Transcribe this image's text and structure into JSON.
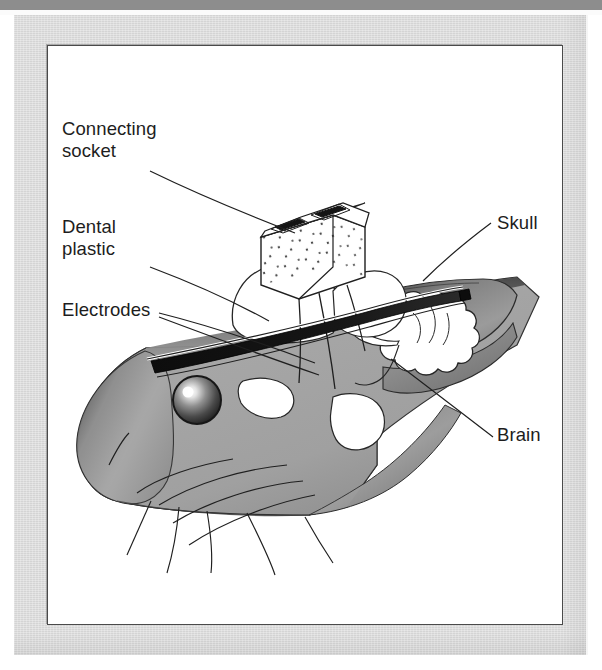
{
  "figure": {
    "kind": "anatomical-diagram",
    "labels": [
      {
        "id": "connecting-socket",
        "text": "Connecting\nsocket",
        "side": "left"
      },
      {
        "id": "dental-plastic",
        "text": "Dental\nplastic",
        "side": "left"
      },
      {
        "id": "electrodes",
        "text": "Electrodes",
        "side": "left"
      },
      {
        "id": "skull",
        "text": "Skull",
        "side": "right"
      },
      {
        "id": "brain",
        "text": "Brain",
        "side": "right"
      }
    ],
    "parts": [
      {
        "id": "connecting-socket",
        "name": "connecting socket",
        "appearance": "white rectangular block with speckled texture and two dark contact slots on top"
      },
      {
        "id": "dental-plastic",
        "name": "dental plastic",
        "appearance": "white rounded mound cemented on top of the skull"
      },
      {
        "id": "electrodes",
        "name": "electrodes",
        "appearance": "dark tapered wire bundle running from socket into the brain"
      },
      {
        "id": "skull",
        "name": "skull",
        "appearance": "gray domed bone shell over the brain"
      },
      {
        "id": "brain",
        "name": "brain",
        "appearance": "white lobed cerebellum-like mass inside the skull"
      },
      {
        "id": "eye",
        "name": "eye",
        "appearance": "dark shaded sphere with white specular highlight"
      },
      {
        "id": "whiskers",
        "name": "whiskers",
        "appearance": "thin curved lines radiating from the snout"
      }
    ],
    "colors": {
      "page_background": "#ffffff",
      "scan_top_bar": "#8d8d8d",
      "scan_paper": "#dcdcdc",
      "figure_background": "#ffffff",
      "figure_border": "#4a4a4a",
      "ink": "#1d1d1d",
      "head_fill": "#9a9a9a",
      "head_shadow": "#4f4f4f",
      "skull_fill": "#8f8f8f",
      "electrode_dark": "#111111"
    }
  }
}
